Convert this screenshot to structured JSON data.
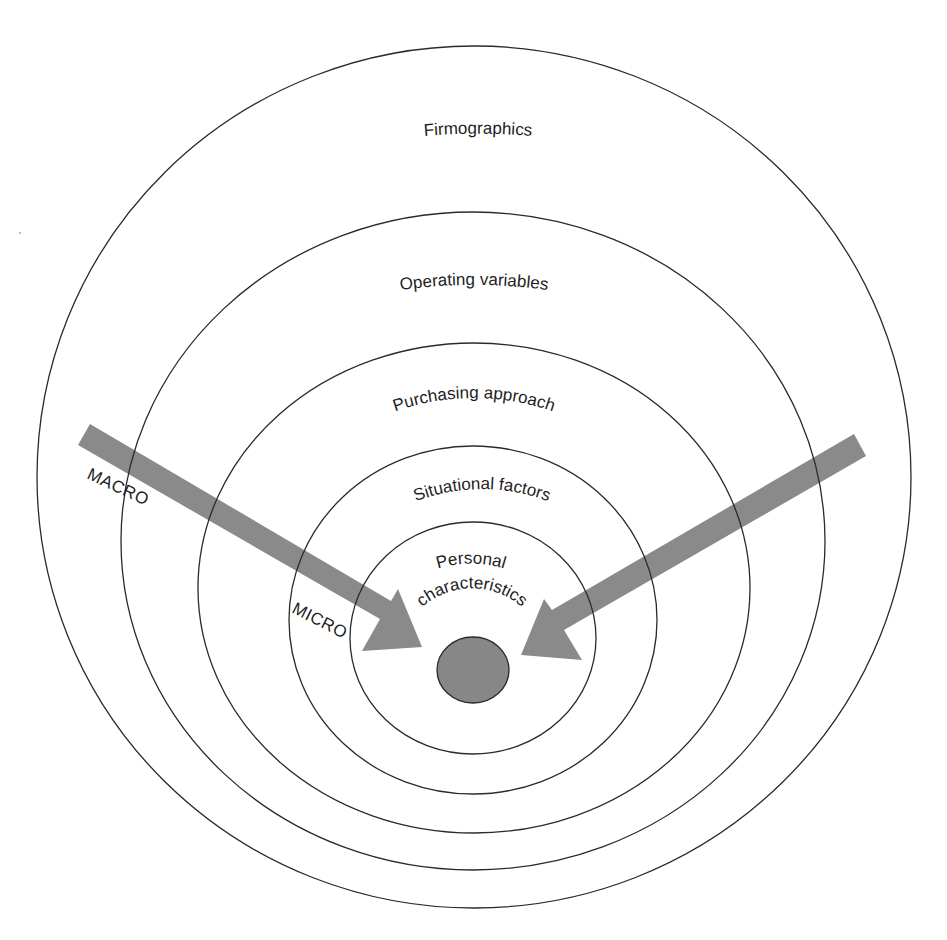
{
  "diagram": {
    "type": "nested-segmentation-model",
    "rings": [
      {
        "id": "firmographics",
        "label": "Firmographics",
        "level": 1
      },
      {
        "id": "operating-variables",
        "label": "Operating variables",
        "level": 2
      },
      {
        "id": "purchasing-approach",
        "label": "Purchasing approach",
        "level": 3
      },
      {
        "id": "situational-factors",
        "label": "Situational factors",
        "level": 4
      },
      {
        "id": "personal-characteristics",
        "label_line1": "Personal",
        "label_line2": "characteristics",
        "level": 5
      }
    ],
    "arrows": {
      "left_label": "MACRO",
      "inner_label": "MICRO"
    },
    "colors": {
      "ring_stroke": "#2a2a2a",
      "arrow_fill": "#8a8a8a",
      "core_fill": "#878787",
      "text": "#1e1e1e",
      "background": "#ffffff"
    }
  }
}
